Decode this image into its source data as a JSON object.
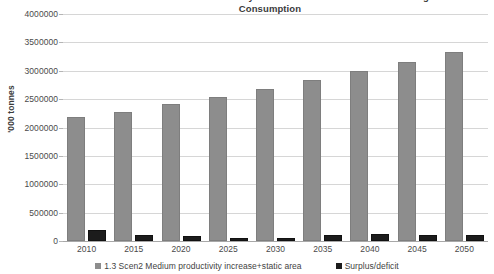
{
  "chart_data": {
    "type": "bar",
    "title": "1.3 Scen2 Medium Productivity Increase + Static Area and Increasing Consumption",
    "title_line1": "1.3 Scen2 Medium Productivity Increase + Static Area and Increasing",
    "title_line2": "Consumption",
    "xlabel": "",
    "ylabel": "'000 tonnes",
    "ylim": [
      0,
      4000000
    ],
    "ytick_step": 500000,
    "ytick_labels": [
      "4000000",
      "3500000",
      "3000000",
      "2500000",
      "2000000",
      "1500000",
      "1000000",
      "500000",
      "0"
    ],
    "ytick_values": [
      4000000,
      3500000,
      3000000,
      2500000,
      2000000,
      1500000,
      1000000,
      500000,
      0
    ],
    "grid": true,
    "legend_position": "bottom",
    "categories": [
      "2010",
      "2015",
      "2020",
      "2025",
      "2030",
      "2035",
      "2040",
      "2045",
      "2050"
    ],
    "series": [
      {
        "name": "1.3 Scen2 Medium productivity increase+static area",
        "color": "#8d8d8d",
        "values": [
          2190000,
          2280000,
          2420000,
          2540000,
          2680000,
          2840000,
          2990000,
          3160000,
          3330000
        ]
      },
      {
        "name": "Surplus/deficit",
        "color": "#1c1c1c",
        "values": [
          190000,
          110000,
          80000,
          50000,
          60000,
          100000,
          120000,
          110000,
          100000
        ]
      }
    ]
  },
  "legend": {
    "items": [
      {
        "label": "1.3 Scen2 Medium productivity increase+static area"
      },
      {
        "label": "Surplus/deficit"
      }
    ]
  }
}
